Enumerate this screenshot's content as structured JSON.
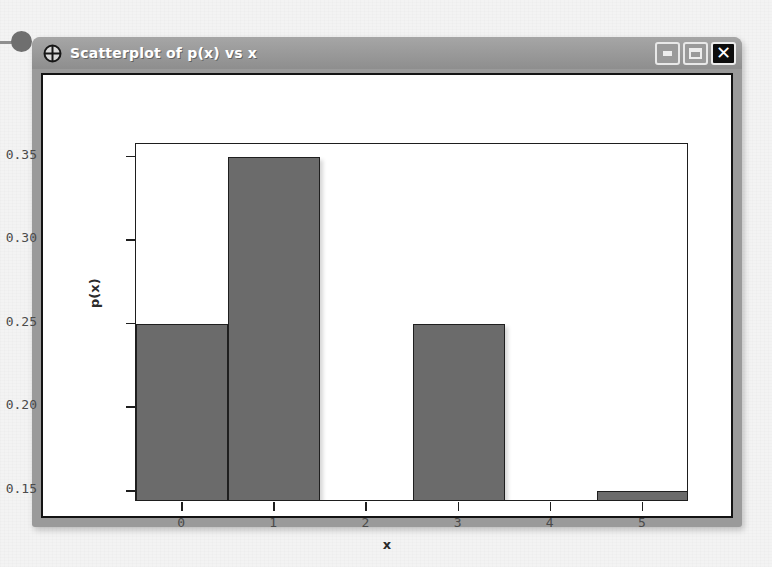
{
  "window": {
    "title": "Scatterplot of p(x) vs x",
    "icon": "crosshair-target-icon",
    "buttons": {
      "minimize": "minimize-icon",
      "maximize": "maximize-icon",
      "close": "✕"
    }
  },
  "chart_data": {
    "type": "bar",
    "title": "Scatterplot of p(x) vs x",
    "xlabel": "x",
    "ylabel": "p(x)",
    "categories": [
      "0",
      "1",
      "2",
      "3",
      "4",
      "5"
    ],
    "x": [
      0,
      1,
      2,
      3,
      4,
      5
    ],
    "values": [
      0.25,
      0.35,
      0,
      0.25,
      0,
      0.15
    ],
    "bars_drawn": [
      {
        "x": 0,
        "value": 0.25
      },
      {
        "x": 1,
        "value": 0.35
      },
      {
        "x": 3,
        "value": 0.25
      },
      {
        "x": 5,
        "value": 0.15
      }
    ],
    "xticks": [
      "0",
      "1",
      "2",
      "3",
      "4",
      "5"
    ],
    "yticks": [
      "0.15",
      "0.20",
      "0.25",
      "0.30",
      "0.35"
    ],
    "ylim": [
      0.1435,
      0.3575
    ],
    "xlim": [
      -0.5,
      5.5
    ],
    "grid": false,
    "legend": null,
    "bar_color": "#6b6b6b",
    "bar_edge_color": "#1f1f1f",
    "axes_color": "#1e1e1e",
    "plot_background": "#ffffff"
  }
}
